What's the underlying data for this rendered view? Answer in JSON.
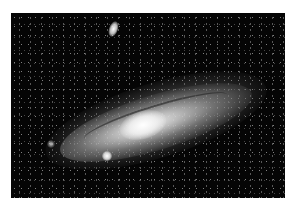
{
  "image": {
    "subject": "spiral galaxy with two satellite galaxies against a star field",
    "palette": {
      "background": "#ffffff",
      "sky": "#050505",
      "core": "#ffffff",
      "disk": "#bdbdbd"
    }
  }
}
